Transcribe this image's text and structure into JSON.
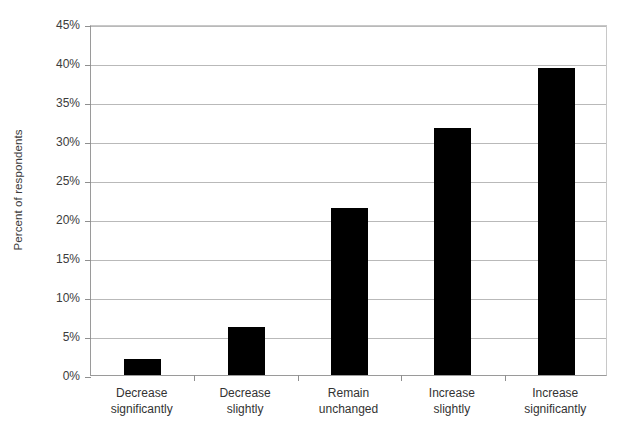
{
  "chart_data": {
    "type": "bar",
    "title": "",
    "subtitle": "",
    "xlabel": "",
    "ylabel": "Percent of respondents",
    "categories": [
      "Decrease significantly",
      "Decrease slightly",
      "Remain unchanged",
      "Increase slightly",
      "Increase significantly"
    ],
    "category_lines": [
      [
        "Decrease",
        "significantly"
      ],
      [
        "Decrease",
        "slightly"
      ],
      [
        "Remain",
        "unchanged"
      ],
      [
        "Increase",
        "slightly"
      ],
      [
        "Increase",
        "significantly"
      ]
    ],
    "values": [
      2.1,
      6.2,
      21.4,
      31.7,
      39.3
    ],
    "value_labels": [
      "2.1%",
      "6.2%",
      "21.4%",
      "31.7%",
      "39.3%"
    ],
    "ylim": [
      0,
      45
    ],
    "ytick_step": 5,
    "ytick_values": [
      0,
      5,
      10,
      15,
      20,
      25,
      30,
      35,
      40,
      45
    ],
    "ytick_labels": [
      "0%",
      "5%",
      "10%",
      "15%",
      "20%",
      "25%",
      "30%",
      "35%",
      "40%",
      "45%"
    ],
    "grid": true,
    "grid_axis": "y",
    "legend": false,
    "legend_position": "none",
    "bar_color": "#000000",
    "gridline_color": "#b9b9b9",
    "axis_color": "#9a9a9a",
    "background_color": "#ffffff",
    "series": [
      {
        "name": "Percent of respondents",
        "values": [
          2.1,
          6.2,
          21.4,
          31.7,
          39.3
        ]
      }
    ]
  }
}
